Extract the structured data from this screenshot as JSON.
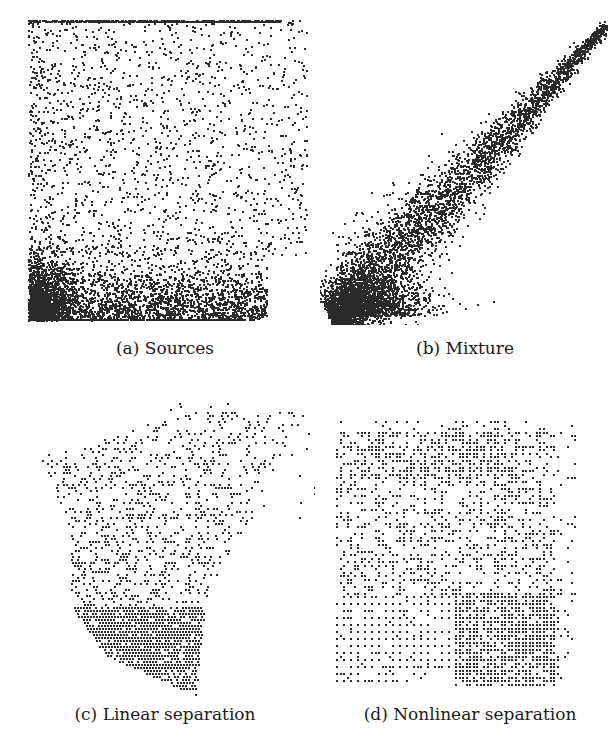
{
  "figure": {
    "panels": [
      {
        "id": "a",
        "caption": "(a) Sources"
      },
      {
        "id": "b",
        "caption": "(b) Mixture"
      },
      {
        "id": "c",
        "caption": "(c) Linear separation"
      },
      {
        "id": "d",
        "caption": "(d) Nonlinear separation"
      }
    ]
  },
  "colors": {
    "point": "#2a2a2a",
    "background": "#ffffff"
  },
  "chart_data": [
    {
      "type": "scatter",
      "title": "(a) Sources",
      "xlabel": "",
      "ylabel": "",
      "grid": false,
      "description": "Two independent sources; dense cluster along bottom edge and left corner, uniform sparse spread above, dense band along top edge",
      "axis_ranges": {
        "x": [
          0,
          1
        ],
        "y": [
          0,
          1
        ]
      },
      "n_points_approx": 6000
    },
    {
      "type": "scatter",
      "title": "(b) Mixture",
      "xlabel": "",
      "ylabel": "",
      "grid": false,
      "description": "Linearly mixed sources forming elongated diagonal cloud from bottom-left (dense) toward top-right (sparse tail)",
      "axis_ranges": {
        "x": [
          0,
          1
        ],
        "y": [
          0,
          1
        ]
      },
      "n_points_approx": 6000
    },
    {
      "type": "scatter",
      "title": "(c) Linear separation",
      "xlabel": "",
      "ylabel": "",
      "grid": false,
      "description": "Linearly unmixed data on a diagonal lattice; dense hatched region at bottom, sparse tail to upper-right",
      "axis_ranges": {
        "x": [
          0,
          1
        ],
        "y": [
          0,
          1
        ]
      },
      "n_points_approx": 3500
    },
    {
      "type": "scatter",
      "title": "(d) Nonlinear separation",
      "xlabel": "",
      "ylabel": "",
      "grid": false,
      "description": "Nonlinearly unmixed data on a regular lattice filling a roughly square region; regular grid of dots in lower-left",
      "axis_ranges": {
        "x": [
          0,
          1
        ],
        "y": [
          0,
          1
        ]
      },
      "n_points_approx": 3500
    }
  ]
}
